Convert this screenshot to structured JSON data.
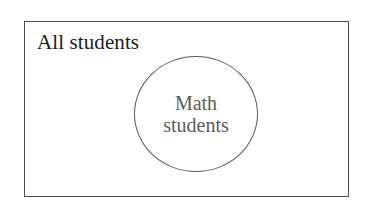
{
  "diagram": {
    "type": "venn-subset",
    "universe": {
      "label": "All students",
      "shape": "rectangle",
      "border_color": "#4a4a4a",
      "fill_color": "#ffffff"
    },
    "subset": {
      "label_line1": "Math",
      "label_line2": "students",
      "label_full": "Math students",
      "shape": "circle",
      "border_color": "#5a5a5a",
      "text_color": "#5c5c5c"
    }
  },
  "canvas": {
    "background": "#ffffff",
    "width": 381,
    "height": 206
  }
}
